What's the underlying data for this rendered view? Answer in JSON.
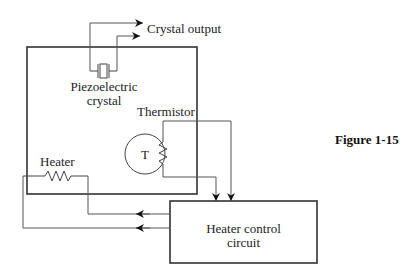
{
  "diagram": {
    "figure_label": "Figure 1-15",
    "crystal_output_label": "Crystal output",
    "piezo_label_line1": "Piezoelectric",
    "piezo_label_line2": "crystal",
    "thermistor_label": "Thermistor",
    "thermistor_symbol": "T",
    "heater_label": "Heater",
    "control_label_line1": "Heater control",
    "control_label_line2": "circuit",
    "colors": {
      "line": "#333333",
      "wire": "#555555",
      "text": "#222222"
    }
  }
}
